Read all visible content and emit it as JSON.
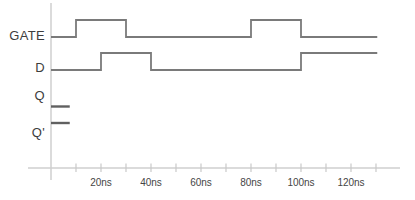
{
  "figure": {
    "kind": "digital-timing-diagram",
    "time_unit": "ns"
  },
  "labels": {
    "gate": "GATE",
    "d": "D",
    "q": "Q",
    "q_prime": "Q'"
  },
  "chart_data": {
    "type": "line",
    "subtype": "digital-timing-step-waveforms",
    "title": "",
    "xlabel": "",
    "ylabel": "",
    "x_unit": "ns",
    "xlim_ns": [
      0,
      130.5
    ],
    "x_ticks_ns": [
      10,
      20,
      30,
      40,
      50,
      60,
      70,
      80,
      90,
      100,
      110,
      120,
      130
    ],
    "x_tick_labels": [
      "20ns",
      "40ns",
      "60ns",
      "80ns",
      "100ns",
      "120ns"
    ],
    "x_tick_label_positions_ns": [
      20,
      40,
      60,
      80,
      100,
      120
    ],
    "grid": false,
    "legend": false,
    "series": [
      {
        "name": "GATE",
        "style": "waveform",
        "levels": [
          {
            "t": 0,
            "v": 0
          },
          {
            "t": 10,
            "v": 1
          },
          {
            "t": 30,
            "v": 0
          },
          {
            "t": 80,
            "v": 1
          },
          {
            "t": 100,
            "v": 0
          }
        ],
        "end_ns": 130.5
      },
      {
        "name": "D",
        "style": "waveform",
        "levels": [
          {
            "t": 0,
            "v": 0
          },
          {
            "t": 20,
            "v": 1
          },
          {
            "t": 40,
            "v": 0
          },
          {
            "t": 100,
            "v": 1
          }
        ],
        "end_ns": 130.5
      },
      {
        "name": "Q",
        "style": "initial-stub",
        "levels": [
          {
            "t": 0,
            "v": 0
          }
        ],
        "end_ns": 7.5,
        "note": "only initial value drawn; remainder of trace blank"
      },
      {
        "name": "Q'",
        "style": "initial-stub",
        "levels": [
          {
            "t": 0,
            "v": 1
          }
        ],
        "end_ns": 7.5,
        "note": "only initial value drawn; remainder of trace blank"
      }
    ]
  },
  "colors": {
    "background": "#ffffff",
    "waveform": "#7a7a7a",
    "initial_stub": "#606060",
    "axis": "#cfcfcf",
    "tick": "#c9c9c9",
    "signal_label_text": "#3d3d3d",
    "tick_label_text": "#454545"
  }
}
